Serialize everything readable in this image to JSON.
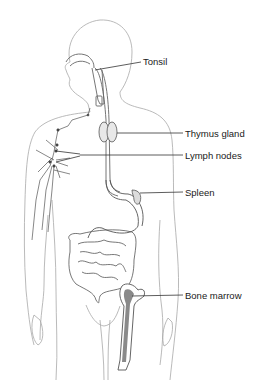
{
  "diagram": {
    "type": "anatomical-illustration",
    "colors": {
      "outline": "#9a9a9a",
      "organ_line": "#555555",
      "leader_line": "#333333",
      "marrow_fill": "#8a8a8a",
      "text": "#1a1a1a",
      "background": "#ffffff"
    },
    "labels": [
      {
        "id": "tonsil",
        "text": "Tonsil",
        "x": 143,
        "y": 57
      },
      {
        "id": "thymus",
        "text": "Thymus gland",
        "x": 185,
        "y": 129
      },
      {
        "id": "lymph-nodes",
        "text": "Lymph nodes",
        "x": 185,
        "y": 151
      },
      {
        "id": "spleen",
        "text": "Spleen",
        "x": 185,
        "y": 188
      },
      {
        "id": "bone-marrow",
        "text": "Bone marrow",
        "x": 185,
        "y": 291
      }
    ]
  }
}
